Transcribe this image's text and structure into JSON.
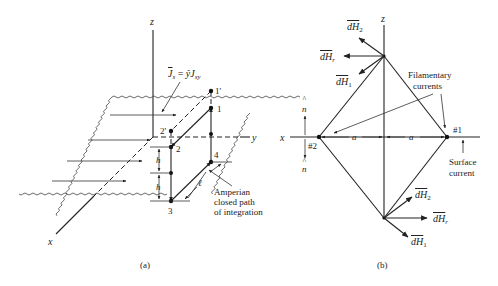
{
  "figure": {
    "panel_a": {
      "caption": "(a)",
      "axes": {
        "z": "z",
        "y": "y",
        "x": "x"
      },
      "current_density_label": {
        "base": "J",
        "sub": "s",
        "eq": " = ",
        "hat": "ŷ",
        "rhs": "J",
        "rhs_sub": "sy"
      },
      "points": [
        "1'",
        "1",
        "2'",
        "2",
        "3",
        "4"
      ],
      "dimension_labels": {
        "h_upper": "h",
        "h_lower": "h",
        "length": "ℓ"
      },
      "path_label": [
        "Amperian",
        "closed path",
        "of integration"
      ]
    },
    "panel_b": {
      "caption": "(b)",
      "axes": {
        "z": "z",
        "x": "x"
      },
      "top_vectors": [
        {
          "name": "dH",
          "sub": "2"
        },
        {
          "name": "dH",
          "sub": "r"
        },
        {
          "name": "dH",
          "sub": "1"
        }
      ],
      "bottom_vectors": [
        {
          "name": "dH",
          "sub": "2"
        },
        {
          "name": "dH",
          "sub": "r"
        },
        {
          "name": "dH",
          "sub": "1"
        }
      ],
      "filament_label": [
        "Filamentary",
        "currents"
      ],
      "filament_ids": [
        "#1",
        "#2"
      ],
      "spacing_label": "a",
      "normal_label": "n",
      "surface_label": [
        "Surface",
        "current"
      ]
    }
  }
}
